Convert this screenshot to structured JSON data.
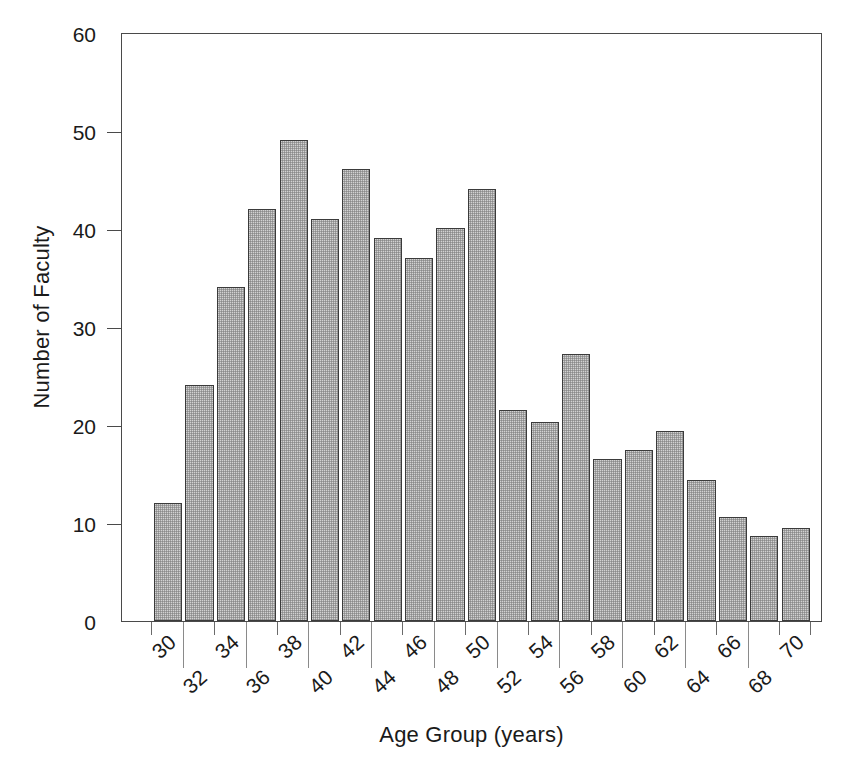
{
  "chart_data": {
    "type": "bar",
    "title": "",
    "xlabel": "Age Group (years)",
    "ylabel": "Number of Faculty",
    "categories": [
      "30",
      "32",
      "34",
      "36",
      "38",
      "40",
      "42",
      "44",
      "46",
      "48",
      "50",
      "52",
      "54",
      "56",
      "58",
      "60",
      "62",
      "64",
      "66",
      "68",
      "70"
    ],
    "values": [
      12,
      24,
      34,
      42,
      49,
      41,
      46,
      39,
      37,
      40,
      44,
      21.5,
      20.3,
      27.2,
      16.5,
      17.4,
      19.4,
      14.4,
      10.6,
      8.7,
      9.5
    ],
    "xlim": [
      30,
      72
    ],
    "ylim": [
      0,
      60
    ],
    "yticks": [
      0,
      10,
      20,
      30,
      40,
      50,
      60
    ],
    "ytick_labels": [
      "0",
      "10",
      "20",
      "30",
      "40",
      "50",
      "60"
    ],
    "xtick_labels": [
      "30",
      "32",
      "34",
      "36",
      "38",
      "40",
      "42",
      "44",
      "46",
      "48",
      "50",
      "52",
      "54",
      "56",
      "58",
      "60",
      "62",
      "64",
      "66",
      "68",
      "70"
    ],
    "grid": false,
    "legend": null,
    "bar_fill_color": "#d2d2d2",
    "bar_edge_color": "#3b3b3b",
    "axis_color": "#4a4a4a",
    "text_color": "#1a1a1a",
    "background_color": "#ffffff",
    "xtick_label_rotation": -42
  }
}
